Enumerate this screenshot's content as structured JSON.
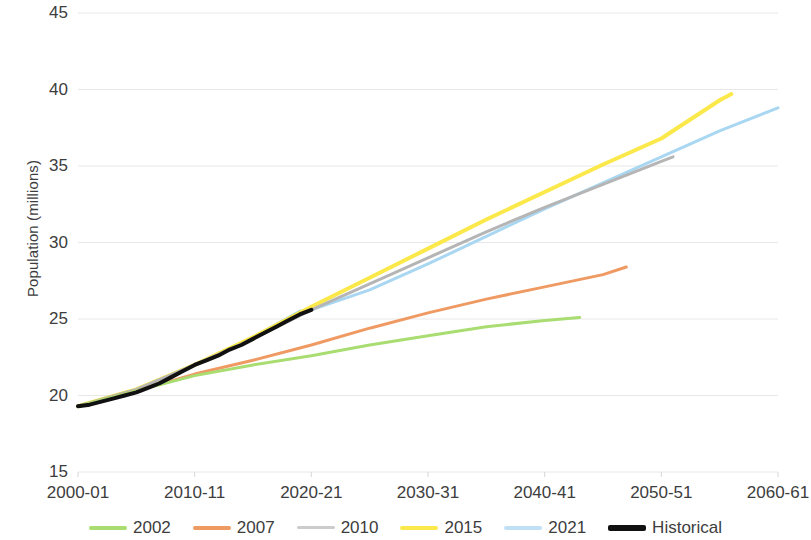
{
  "chart_data": {
    "type": "line",
    "title": "",
    "xlabel": "",
    "ylabel": "Population (millions)",
    "ylim": [
      15,
      45
    ],
    "xlim": [
      2000,
      2060
    ],
    "grid": true,
    "legend_position": "bottom",
    "y_ticks": [
      15,
      20,
      25,
      30,
      35,
      40,
      45
    ],
    "y_tick_labels": [
      "15",
      "20",
      "25",
      "30",
      "35",
      "40",
      "45"
    ],
    "x_ticks": [
      2000,
      2010,
      2020,
      2030,
      2040,
      2050,
      2060
    ],
    "x_tick_labels": [
      "2000-01",
      "2010-11",
      "2020-21",
      "2030-31",
      "2040-41",
      "2050-51",
      "2060-61"
    ],
    "colors": {
      "2002": "#a9dd72",
      "2007": "#ef9a63",
      "2010": "#b5b5b5",
      "2015": "#fbe84a",
      "2021": "#a9d7f2",
      "Historical": "#111111"
    },
    "series": [
      {
        "name": "Historical",
        "color": "#111111",
        "width": 4,
        "x": [
          2000,
          2001,
          2002,
          2003,
          2004,
          2005,
          2006,
          2007,
          2008,
          2009,
          2010,
          2011,
          2012,
          2013,
          2014,
          2015,
          2016,
          2017,
          2018,
          2019,
          2020
        ],
        "values": [
          19.3,
          19.4,
          19.6,
          19.8,
          20.0,
          20.2,
          20.5,
          20.8,
          21.2,
          21.6,
          22.0,
          22.3,
          22.6,
          23.0,
          23.3,
          23.7,
          24.1,
          24.5,
          24.9,
          25.3,
          25.6
        ]
      },
      {
        "name": "2002",
        "color": "#a9dd72",
        "width": 3,
        "x": [
          2000,
          2005,
          2010,
          2015,
          2020,
          2025,
          2030,
          2035,
          2040,
          2043
        ],
        "values": [
          19.3,
          20.3,
          21.3,
          22.0,
          22.6,
          23.3,
          23.9,
          24.5,
          24.9,
          25.1
        ]
      },
      {
        "name": "2007",
        "color": "#ef9a63",
        "width": 3,
        "x": [
          2000,
          2005,
          2010,
          2015,
          2020,
          2025,
          2030,
          2035,
          2040,
          2045,
          2047
        ],
        "values": [
          19.3,
          20.3,
          21.4,
          22.3,
          23.3,
          24.4,
          25.4,
          26.3,
          27.1,
          27.9,
          28.4
        ]
      },
      {
        "name": "2010",
        "color": "#b5b5b5",
        "width": 3,
        "x": [
          2000,
          2005,
          2010,
          2015,
          2020,
          2025,
          2030,
          2035,
          2040,
          2045,
          2050,
          2051
        ],
        "values": [
          19.3,
          20.4,
          22.0,
          23.7,
          25.6,
          27.3,
          29.0,
          30.7,
          32.3,
          33.8,
          35.3,
          35.6
        ]
      },
      {
        "name": "2015",
        "color": "#fbe84a",
        "width": 4,
        "x": [
          2000,
          2005,
          2010,
          2015,
          2020,
          2025,
          2030,
          2035,
          2040,
          2045,
          2050,
          2055,
          2056
        ],
        "values": [
          19.3,
          20.4,
          22.0,
          23.8,
          25.8,
          27.7,
          29.6,
          31.5,
          33.3,
          35.1,
          36.8,
          39.3,
          39.7
        ]
      },
      {
        "name": "2021",
        "color": "#a9d7f2",
        "width": 3,
        "x": [
          2000,
          2005,
          2010,
          2015,
          2019,
          2020,
          2025,
          2030,
          2035,
          2040,
          2045,
          2050,
          2055,
          2060
        ],
        "values": [
          19.3,
          20.4,
          22.0,
          23.8,
          25.5,
          25.6,
          26.9,
          28.6,
          30.4,
          32.2,
          33.9,
          35.6,
          37.3,
          38.8
        ]
      }
    ]
  },
  "legend": {
    "items": [
      {
        "label": "2002",
        "color": "#a9dd72",
        "width": 4
      },
      {
        "label": "2007",
        "color": "#ef9a63",
        "width": 4
      },
      {
        "label": "2010",
        "color": "#cccccc",
        "width": 3
      },
      {
        "label": "2015",
        "color": "#fbe84a",
        "width": 4
      },
      {
        "label": "2021",
        "color": "#bfe0f5",
        "width": 4
      },
      {
        "label": "Historical",
        "color": "#111111",
        "width": 6
      }
    ]
  }
}
